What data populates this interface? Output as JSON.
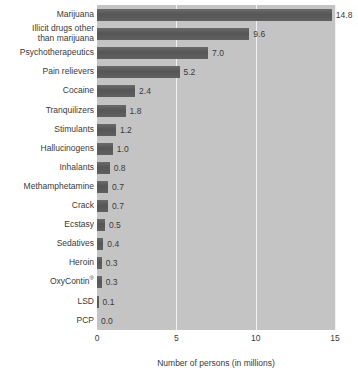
{
  "chart_data": {
    "type": "bar",
    "orientation": "horizontal",
    "title": "",
    "xlabel": "Number of persons (in millions)",
    "ylabel": "",
    "xlim": [
      0,
      15
    ],
    "xticks": [
      "0",
      "5",
      "10",
      "15"
    ],
    "xtick_values": [
      0,
      5,
      10,
      15
    ],
    "grid": "vertical-white-gridlines",
    "legend": "none",
    "categories": [
      "Marijuana",
      "Illicit drugs other\nthan marijuana",
      "Psychotherapeutics",
      "Pain relievers",
      "Cocaine",
      "Tranquilizers",
      "Stimulants",
      "Hallucinogens",
      "Inhalants",
      "Methamphetamine",
      "Crack",
      "Ecstasy",
      "Sedatives",
      "Heroin",
      "OxyContin®",
      "LSD",
      "PCP"
    ],
    "values": [
      14.8,
      9.6,
      7.0,
      5.2,
      2.4,
      1.8,
      1.2,
      1.0,
      0.8,
      0.7,
      0.7,
      0.5,
      0.4,
      0.3,
      0.3,
      0.1,
      0.0
    ],
    "value_labels": [
      "14.8",
      "9.6",
      "7.0",
      "5.2",
      "2.4",
      "1.8",
      "1.2",
      "1.0",
      "0.8",
      "0.7",
      "0.7",
      "0.5",
      "0.4",
      "0.3",
      "0.3",
      "0.1",
      "0.0"
    ],
    "colors": {
      "bar": "#5d5d5d",
      "plot_background": "#c4c4c4",
      "gridline": "#f2f2f2",
      "page_background": "#ffffff",
      "text": "#3a3a3a"
    }
  }
}
